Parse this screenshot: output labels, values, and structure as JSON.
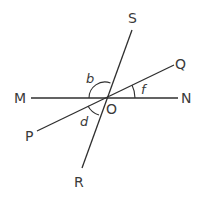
{
  "diagram": {
    "center": {
      "label": "O",
      "x": 105,
      "y": 98
    },
    "points": [
      {
        "label": "M",
        "x": 31,
        "y": 98
      },
      {
        "label": "N",
        "x": 178,
        "y": 98
      },
      {
        "label": "S",
        "x": 132,
        "y": 30
      },
      {
        "label": "R",
        "x": 82,
        "y": 168
      },
      {
        "label": "Q",
        "x": 174,
        "y": 65
      },
      {
        "label": "P",
        "x": 37,
        "y": 131
      }
    ],
    "lines": [
      {
        "name": "MN",
        "from": "M",
        "to": "N"
      },
      {
        "name": "SR",
        "from": "S",
        "to": "R"
      },
      {
        "name": "QP",
        "from": "Q",
        "to": "P"
      }
    ],
    "angles": [
      {
        "label": "b",
        "between": [
          "OM",
          "OS"
        ]
      },
      {
        "label": "f",
        "between": [
          "ON",
          "OQ"
        ]
      },
      {
        "label": "d",
        "between": [
          "OP",
          "OR"
        ]
      }
    ],
    "labels": {
      "M": "M",
      "N": "N",
      "S": "S",
      "R": "R",
      "Q": "Q",
      "P": "P",
      "O": "O",
      "b": "b",
      "f": "f",
      "d": "d"
    },
    "colors": {
      "line": "#2f2f2f",
      "text": "#3a3a3a",
      "background": "#ffffff"
    }
  }
}
